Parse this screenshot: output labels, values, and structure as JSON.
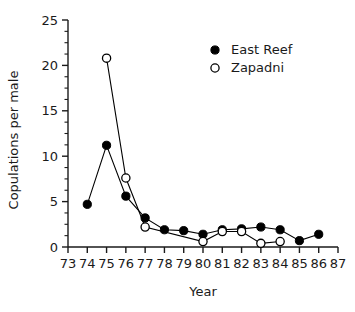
{
  "chart_data": {
    "type": "line",
    "title": "",
    "xlabel": "Year",
    "ylabel": "Copulations per male",
    "xlim": [
      73,
      87
    ],
    "ylim": [
      0,
      25
    ],
    "xticks": [
      73,
      74,
      75,
      76,
      77,
      78,
      79,
      80,
      81,
      82,
      83,
      84,
      85,
      86,
      87
    ],
    "xtick_labels": [
      "73",
      "74",
      "75",
      "76",
      "77",
      "78",
      "79",
      "80",
      "81",
      "82",
      "83",
      "84",
      "85",
      "86",
      "87"
    ],
    "yticks": [
      0,
      5,
      10,
      15,
      20,
      25
    ],
    "ytick_labels": [
      "0",
      "5",
      "10",
      "15",
      "20",
      "25"
    ],
    "y_minor_tick_step": 1.25,
    "grid": false,
    "legend_position": "upper right",
    "series": [
      {
        "name": "East Reef",
        "marker": "filled-circle",
        "color": "#000000",
        "x": [
          74,
          75,
          76,
          77,
          78,
          79,
          80,
          81,
          82,
          83,
          84,
          85,
          86
        ],
        "values": [
          4.7,
          11.2,
          5.6,
          3.2,
          1.9,
          1.8,
          1.4,
          1.9,
          2.0,
          2.2,
          1.9,
          0.7,
          1.4
        ]
      },
      {
        "name": "Zapadni",
        "marker": "open-circle",
        "color": "#000000",
        "x": [
          75,
          76,
          77,
          80,
          81,
          82,
          83,
          84
        ],
        "values": [
          20.8,
          7.6,
          2.2,
          0.6,
          1.7,
          1.7,
          0.4,
          0.6
        ]
      }
    ]
  },
  "legend": {
    "entries": [
      {
        "label": "East Reef",
        "marker": "filled-circle"
      },
      {
        "label": "Zapadni",
        "marker": "open-circle"
      }
    ]
  },
  "axes": {
    "x_title": "Year",
    "y_title": "Copulations per male"
  }
}
